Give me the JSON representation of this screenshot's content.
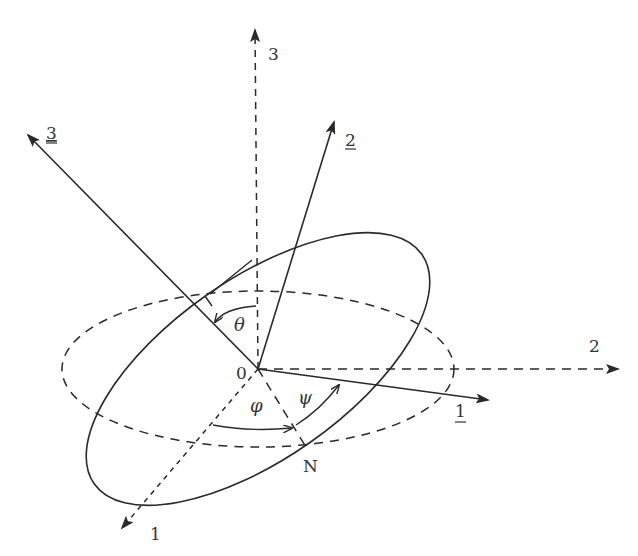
{
  "diagram": {
    "origin_label": "0",
    "node_label": "N",
    "fixed_axes": [
      {
        "id": "1",
        "label": "1",
        "style": "dashed"
      },
      {
        "id": "2",
        "label": "2",
        "style": "dashed"
      },
      {
        "id": "3",
        "label": "3",
        "style": "dashed"
      }
    ],
    "body_axes": [
      {
        "id": "1u",
        "label": "1",
        "underlined": true,
        "style": "solid"
      },
      {
        "id": "2u",
        "label": "2",
        "underlined": true,
        "style": "solid"
      },
      {
        "id": "3u",
        "label": "3",
        "underlined": true,
        "style": "solid"
      }
    ],
    "angles": [
      {
        "id": "theta",
        "label": "θ"
      },
      {
        "id": "phi",
        "label": "φ"
      },
      {
        "id": "psi",
        "label": "ψ"
      }
    ],
    "colors": {
      "stroke": "#2a2a2a",
      "text": "#333333"
    }
  }
}
